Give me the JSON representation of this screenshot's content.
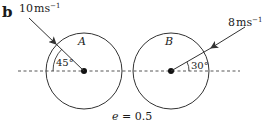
{
  "part_label": "b",
  "ball_a": {
    "name": "A",
    "speed_value": "10",
    "speed_unit": "ms",
    "speed_exp": "−1",
    "angle": "45°"
  },
  "ball_b": {
    "name": "B",
    "speed_value": "8",
    "speed_unit": "ms",
    "speed_exp": "−1",
    "angle": "30°"
  },
  "coefficient": {
    "symbol": "e",
    "equals": " = ",
    "value": "0.5"
  },
  "colors": {
    "stroke": "#333333",
    "text": "#1a1a1a"
  }
}
